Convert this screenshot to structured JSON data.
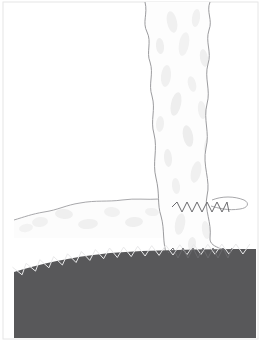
{
  "figure": {
    "width": 272,
    "height": 353,
    "background_color": "#ffffff"
  },
  "colors": {
    "background": "#ffffff",
    "ground_fill": "#58585a",
    "ground_stroke": "#4a4a4c",
    "plume_fill": "#fdfdfd",
    "plume_outline": "#9b9b9e",
    "cloud_fill": "#fcfcfc",
    "cloud_outline": "#a8a8ab",
    "blob_light": "#f0f0f0",
    "blob_mid": "#e8e8e8",
    "zigzag_dark": "#6a6a6d",
    "zigzag_light": "#e9e9ea",
    "frame_border": "#e6e6e6"
  },
  "frame": {
    "label": "figure-frame",
    "left": 3,
    "top": 2,
    "right": 258,
    "bottom": 339
  },
  "ground": {
    "label": "ground-layer",
    "description": "Dark gray solid ground mass occupying lower portion, sloping down to the left",
    "fill": "#58585a",
    "top_left_y": 272,
    "top_right_y": 250,
    "left_x": 14,
    "right_x": 256,
    "bottom_y": 338,
    "surface_path": "M14,272 C40,264 70,257 110,253 C150,250 200,249 256,249"
  },
  "ground_zigzag": {
    "label": "ground-surface-zigzag",
    "description": "Light zigzag line tracing the ground surface contact",
    "stroke": "#e9e9ea",
    "stroke_width": 1,
    "amplitude": 5,
    "segment_length": 7,
    "start_x": 14,
    "end_x": 256,
    "visible": true
  },
  "plume": {
    "label": "eruption-column",
    "description": "Vertical wavy-edged eruption column rising from ground to top of frame",
    "fill": "#fdfdfd",
    "outline": "#9b9b9e",
    "outline_width": 1,
    "top_y": 2,
    "bottom_y": 262,
    "top_left_x": 143,
    "top_right_x": 212,
    "bottom_left_x": 167,
    "bottom_right_x": 232,
    "left_edge_path": "M145,2 C148,14 142,22 147,32 C152,42 146,52 150,62 C154,74 148,84 152,96 C156,110 150,120 154,134 C158,150 152,162 156,178 C160,194 157,204 161,216 C165,230 162,242 167,256 L167,262",
    "right_edge_path": "M210,2 C206,12 213,20 209,30 C205,42 212,52 208,64 C204,78 211,90 207,104 C203,120 210,132 206,148 C202,166 211,180 207,196 C204,210 212,222 210,238 C209,250 232,248 232,256 L232,262"
  },
  "plume_zigzags": [
    {
      "label": "upper-plume-zigzag",
      "description": "Dark zigzag boundary across the column near the cloud-layer level",
      "stroke": "#6a6a6d",
      "stroke_width": 1,
      "y": 207,
      "start_x": 172,
      "end_x": 229,
      "amplitude": 5,
      "segment_length": 5
    },
    {
      "label": "lower-plume-zigzag",
      "description": "Dark zigzag boundary across the column at the ground contact",
      "stroke": "#6a6a6d",
      "stroke_width": 1,
      "y": 253,
      "start_x": 168,
      "end_x": 232,
      "amplitude": 5,
      "segment_length": 5
    }
  ],
  "cloud_layer": {
    "label": "horizontal-ash-cloud",
    "description": "Pale horizontal cloud layer spreading leftward from the base of the column",
    "fill": "#fcfcfc",
    "outline": "#a8a8ab",
    "outline_width": 1,
    "left_x": 14,
    "right_x": 172,
    "top_y": 198,
    "bottom_y": 238,
    "top_path": "M14,220 C24,217 32,214 44,212 C58,210 66,205 80,203 C96,200 108,202 122,200 C136,198 146,200 160,199 C166,199 170,200 172,201"
  },
  "cloud_wisp_right": {
    "label": "right-cloud-wisp",
    "description": "Small cloud wisp extending right from the column near the cloud-layer level",
    "outline": "#a8a8ab",
    "left_x": 210,
    "right_x": 252,
    "y": 203,
    "path": "M212,200 C222,196 234,196 244,200 C250,203 248,208 240,209 C228,211 218,208 211,206"
  },
  "texture_blobs": [
    {
      "label": "blob",
      "cx": 172,
      "cy": 22,
      "rx": 5,
      "ry": 11,
      "fill": "#f0f0f0",
      "rotate": -12
    },
    {
      "label": "blob",
      "cx": 196,
      "cy": 18,
      "rx": 4,
      "ry": 9,
      "fill": "#f1f1f1",
      "rotate": 8
    },
    {
      "label": "blob",
      "cx": 160,
      "cy": 46,
      "rx": 4,
      "ry": 8,
      "fill": "#efefef",
      "rotate": -6
    },
    {
      "label": "blob",
      "cx": 184,
      "cy": 44,
      "rx": 5,
      "ry": 12,
      "fill": "#f2f2f2",
      "rotate": 10
    },
    {
      "label": "blob",
      "cx": 204,
      "cy": 58,
      "rx": 4,
      "ry": 9,
      "fill": "#efefef",
      "rotate": -10
    },
    {
      "label": "blob",
      "cx": 166,
      "cy": 76,
      "rx": 5,
      "ry": 11,
      "fill": "#f0f0f0",
      "rotate": 6
    },
    {
      "label": "blob",
      "cx": 192,
      "cy": 84,
      "rx": 4,
      "ry": 8,
      "fill": "#f1f1f1",
      "rotate": -14
    },
    {
      "label": "blob",
      "cx": 176,
      "cy": 104,
      "rx": 5,
      "ry": 12,
      "fill": "#eeeeee",
      "rotate": 12
    },
    {
      "label": "blob",
      "cx": 202,
      "cy": 110,
      "rx": 4,
      "ry": 9,
      "fill": "#f1f1f1",
      "rotate": -8
    },
    {
      "label": "blob",
      "cx": 160,
      "cy": 124,
      "rx": 4,
      "ry": 8,
      "fill": "#f0f0f0",
      "rotate": 4
    },
    {
      "label": "blob",
      "cx": 188,
      "cy": 136,
      "rx": 5,
      "ry": 11,
      "fill": "#ededed",
      "rotate": -11
    },
    {
      "label": "blob",
      "cx": 208,
      "cy": 146,
      "rx": 4,
      "ry": 9,
      "fill": "#f1f1f1",
      "rotate": 9
    },
    {
      "label": "blob",
      "cx": 168,
      "cy": 158,
      "rx": 4,
      "ry": 9,
      "fill": "#efefef",
      "rotate": -5
    },
    {
      "label": "blob",
      "cx": 196,
      "cy": 172,
      "rx": 5,
      "ry": 11,
      "fill": "#f0f0f0",
      "rotate": 13
    },
    {
      "label": "blob",
      "cx": 176,
      "cy": 186,
      "rx": 4,
      "ry": 8,
      "fill": "#f1f1f1",
      "rotate": -7
    },
    {
      "label": "blob",
      "cx": 180,
      "cy": 224,
      "rx": 5,
      "ry": 11,
      "fill": "#f0f0f0",
      "rotate": 10
    },
    {
      "label": "blob",
      "cx": 206,
      "cy": 230,
      "rx": 4,
      "ry": 9,
      "fill": "#f1f1f1",
      "rotate": -9
    },
    {
      "label": "blob",
      "cx": 192,
      "cy": 244,
      "rx": 4,
      "ry": 7,
      "fill": "#efefef",
      "rotate": 5
    },
    {
      "label": "blob",
      "cx": 40,
      "cy": 222,
      "rx": 8,
      "ry": 5,
      "fill": "#f1f1f1",
      "rotate": -8
    },
    {
      "label": "blob",
      "cx": 64,
      "cy": 214,
      "rx": 9,
      "ry": 5,
      "fill": "#efefef",
      "rotate": 4
    },
    {
      "label": "blob",
      "cx": 88,
      "cy": 224,
      "rx": 10,
      "ry": 5,
      "fill": "#f0f0f0",
      "rotate": -5
    },
    {
      "label": "blob",
      "cx": 112,
      "cy": 212,
      "rx": 8,
      "ry": 5,
      "fill": "#f1f1f1",
      "rotate": 6
    },
    {
      "label": "blob",
      "cx": 134,
      "cy": 222,
      "rx": 9,
      "ry": 5,
      "fill": "#efefef",
      "rotate": -4
    },
    {
      "label": "blob",
      "cx": 152,
      "cy": 212,
      "rx": 7,
      "ry": 4,
      "fill": "#f1f1f1",
      "rotate": 7
    },
    {
      "label": "blob",
      "cx": 26,
      "cy": 228,
      "rx": 7,
      "ry": 4,
      "fill": "#f2f2f2",
      "rotate": -10
    }
  ]
}
